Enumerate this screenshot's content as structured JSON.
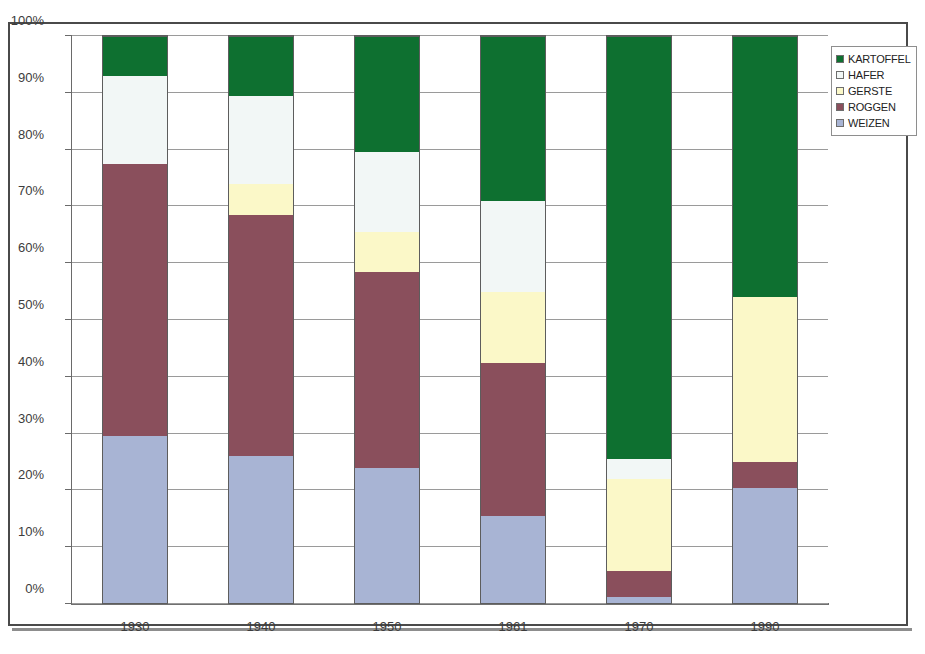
{
  "figure": {
    "title_partial": "o",
    "frame": true
  },
  "legend": {
    "position": "top-right",
    "entries": [
      {
        "label": "KARTOFFEL",
        "color": "#0e7030"
      },
      {
        "label": "HAFER",
        "color": "#f2f7f6"
      },
      {
        "label": "GERSTE",
        "color": "#fbf8c8"
      },
      {
        "label": "ROGGEN",
        "color": "#8a4f5c"
      },
      {
        "label": "WEIZEN",
        "color": "#a8b4d4"
      }
    ]
  },
  "axes": {
    "y_ticks": [
      "0%",
      "10%",
      "20%",
      "30%",
      "40%",
      "50%",
      "60%",
      "70%",
      "80%",
      "90%",
      "100%"
    ],
    "x_ticks": [
      "1930",
      "1940",
      "1950",
      "1961",
      "1970",
      "1990"
    ]
  },
  "chart_data": {
    "type": "bar",
    "stacked": true,
    "stack_mode": "percent",
    "title": "",
    "xlabel": "",
    "ylabel": "",
    "ylim": [
      0,
      100
    ],
    "ytick_format": "percent",
    "grid": true,
    "legend_position": "top-right",
    "categories": [
      "1930",
      "1940",
      "1950",
      "1961",
      "1970",
      "1990"
    ],
    "series": [
      {
        "name": "WEIZEN",
        "color": "#a8b4d4",
        "values": [
          29.5,
          26.0,
          24.0,
          15.5,
          1.2,
          20.5
        ]
      },
      {
        "name": "ROGGEN",
        "color": "#8a4f5c",
        "values": [
          48.0,
          42.5,
          34.5,
          27.0,
          4.6,
          4.5
        ]
      },
      {
        "name": "GERSTE",
        "color": "#fbf8c8",
        "values": [
          0.0,
          5.5,
          7.0,
          12.5,
          16.2,
          29.0
        ]
      },
      {
        "name": "HAFER",
        "color": "#f2f7f6",
        "values": [
          15.5,
          15.5,
          14.0,
          16.0,
          3.5,
          0.0
        ]
      },
      {
        "name": "KARTOFFEL",
        "color": "#0e7030",
        "values": [
          7.0,
          10.5,
          20.5,
          29.0,
          74.5,
          46.0
        ]
      }
    ],
    "cumulative_tops": {
      "1930": {
        "WEIZEN": 29.5,
        "ROGGEN": 77.5,
        "GERSTE": 77.5,
        "HAFER": 93.0,
        "KARTOFFEL": 100
      },
      "1940": {
        "WEIZEN": 26.0,
        "ROGGEN": 68.5,
        "GERSTE": 74.0,
        "HAFER": 89.5,
        "KARTOFFEL": 100
      },
      "1950": {
        "WEIZEN": 24.0,
        "ROGGEN": 58.5,
        "GERSTE": 65.5,
        "HAFER": 79.5,
        "KARTOFFEL": 100
      },
      "1961": {
        "WEIZEN": 15.5,
        "ROGGEN": 42.5,
        "GERSTE": 55.0,
        "HAFER": 71.0,
        "KARTOFFEL": 100
      },
      "1970": {
        "WEIZEN": 1.2,
        "ROGGEN": 5.8,
        "GERSTE": 22.0,
        "HAFER": 25.5,
        "KARTOFFEL": 100
      },
      "1990": {
        "WEIZEN": 20.5,
        "ROGGEN": 25.0,
        "GERSTE": 54.0,
        "HAFER": 54.0,
        "KARTOFFEL": 100
      }
    }
  }
}
